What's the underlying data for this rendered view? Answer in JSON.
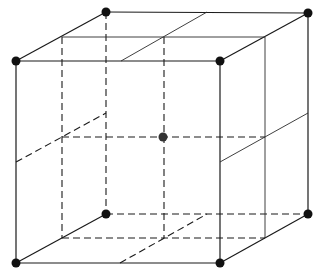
{
  "diagram": {
    "type": "body-centered cubic unit cell",
    "colors": {
      "line": "#1a1a1a",
      "corner_atom": "#111111",
      "center_atom": "#333333",
      "background": "#ffffff"
    },
    "vertices": {
      "front_top_left": [
        16,
        61
      ],
      "front_top_right": [
        220,
        61
      ],
      "front_bottom_left": [
        16,
        263
      ],
      "front_bottom_right": [
        220,
        263
      ],
      "back_top_left": [
        106,
        12
      ],
      "back_top_right": [
        308,
        13
      ],
      "back_bottom_left": [
        106,
        214
      ],
      "back_bottom_right": [
        308,
        214
      ]
    },
    "center_atom": [
      163,
      137
    ],
    "corner_atom_radius": 4.5,
    "center_atom_radius": 4.5
  }
}
